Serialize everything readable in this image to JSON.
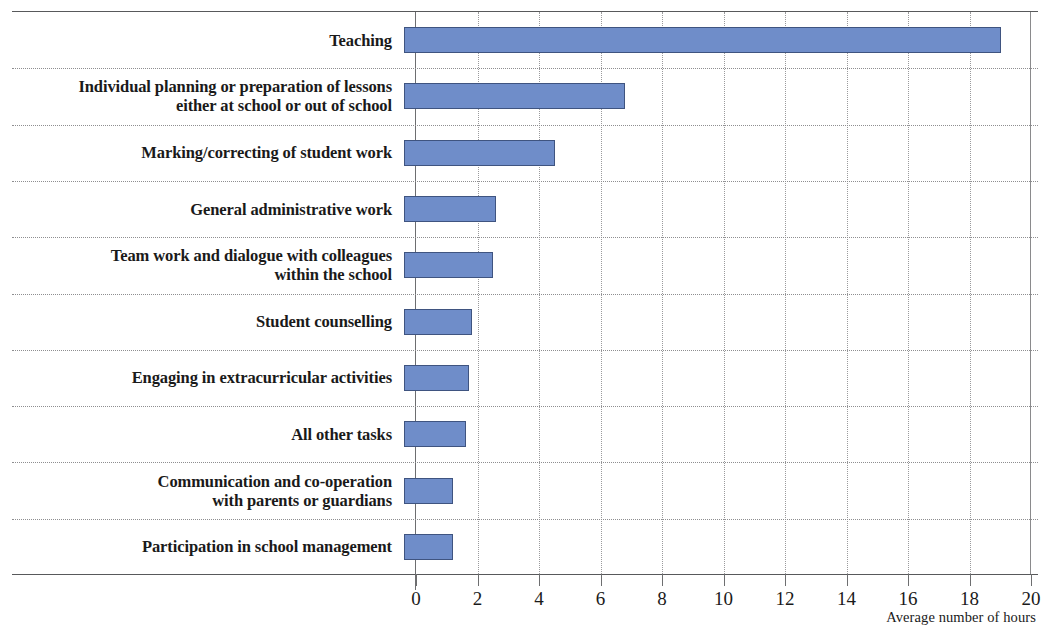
{
  "chart_data": {
    "type": "bar",
    "orientation": "horizontal",
    "title": "",
    "subtitle": "",
    "xlabel": "Average number of hours",
    "ylabel": "",
    "xlim": [
      0,
      20
    ],
    "xticks": [
      "0",
      "2",
      "4",
      "6",
      "8",
      "10",
      "12",
      "14",
      "16",
      "18",
      "20"
    ],
    "xtick_step": 2,
    "grid": {
      "vertical": true,
      "horizontal_separators": true
    },
    "legend": null,
    "bar_color": "#6f8dc9",
    "bar_edge_color": "#3f5480",
    "categories": [
      "Teaching",
      "Individual planning or preparation of lessons\neither at school or out of school",
      "Marking/correcting of student work",
      "General administrative work",
      "Team work and dialogue with colleagues\nwithin the school",
      "Student counselling",
      "Engaging in extracurricular activities",
      "All other tasks",
      "Communication and co-operation\nwith parents or guardians",
      "Participation in school management"
    ],
    "values": [
      19.4,
      7.2,
      4.9,
      3.0,
      2.9,
      2.2,
      2.1,
      2.0,
      1.6,
      1.6
    ]
  }
}
